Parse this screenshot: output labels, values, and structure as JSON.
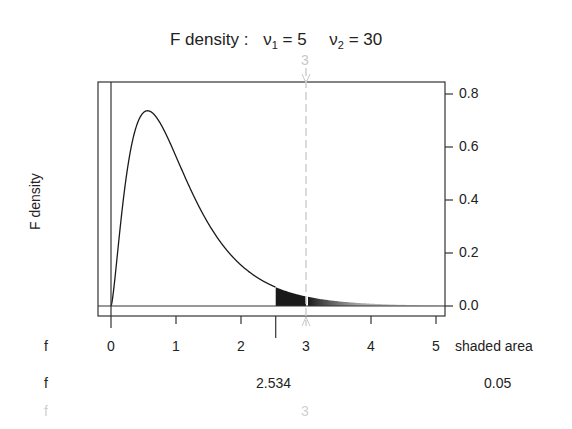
{
  "chart_data": {
    "type": "line",
    "title_parts": {
      "prefix": "F density :",
      "nu1_label": "ν",
      "nu1_sub": "1",
      "nu1_value": "= 5",
      "nu2_label": "ν",
      "nu2_sub": "2",
      "nu2_value": "= 30"
    },
    "df1": 5,
    "df2": 30,
    "ylabel": "F density",
    "xlim": [
      -0.2,
      5.2
    ],
    "ylim": [
      -0.03,
      0.85
    ],
    "x_ticks": [
      "0",
      "1",
      "2",
      "3",
      "4",
      "5"
    ],
    "y_ticks": [
      "0.0",
      "0.2",
      "0.4",
      "0.6",
      "0.8"
    ],
    "y_axis_side": "right",
    "critical_value": 2.534,
    "shaded_area": 0.05,
    "shaded_region": [
      2.534,
      5.2
    ],
    "marker_value": 3,
    "marker_style": "dashed light gray vertical line",
    "curve_peak": {
      "x": 0.55,
      "y": 0.74
    }
  },
  "rows": {
    "axis_row": {
      "label": "f",
      "right_label": "shaded area"
    },
    "critical_row": {
      "label": "f",
      "value": "2.534",
      "area": "0.05"
    },
    "marker_row": {
      "label": "f",
      "value": "3"
    }
  },
  "marker_top_label": "3",
  "colors": {
    "curve": "#1a1a1a",
    "shade": "#1a1a1a",
    "marker": "#c8c8c8",
    "frame": "#333333"
  }
}
